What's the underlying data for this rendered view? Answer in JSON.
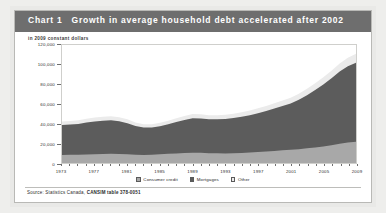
{
  "card": {
    "chart_label": "Chart 1",
    "title": "Growth in average household debt accelerated after 2002",
    "subtitle": "in 2009 constant dollars",
    "source_prefix": "Source: Statistics Canada, ",
    "source_table": "CANSIM table 378-0051",
    "colors": {
      "header_band": "#6e6e6e",
      "consumer_credit": "#a8a8a8",
      "mortgages": "#5c5c5c",
      "other": "#ebebeb",
      "card_background": "#ffffff",
      "page_background": "#e9e9e7",
      "axis": "#6f6f6f"
    }
  },
  "chart_data": {
    "type": "area",
    "stacked": true,
    "title": "Growth in average household debt accelerated after 2002",
    "subtitle": "in 2009 constant dollars",
    "xlabel": "",
    "ylabel": "",
    "ylim": [
      0,
      120000
    ],
    "yticks": [
      0,
      20000,
      40000,
      60000,
      80000,
      100000,
      120000
    ],
    "ytick_labels": [
      "0",
      "20,000",
      "40,000",
      "60,000",
      "80,000",
      "100,000",
      "120,000"
    ],
    "xlim": [
      1973,
      2009
    ],
    "xticks": [
      1973,
      1977,
      1981,
      1985,
      1989,
      1993,
      1997,
      2001,
      2005,
      2009
    ],
    "xtick_labels": [
      "1973",
      "1977",
      "1981",
      "1985",
      "1989",
      "1993",
      "1997",
      "2001",
      "2005",
      "2009"
    ],
    "grid": false,
    "legend_position": "bottom",
    "legend": [
      "Consumer credit",
      "Mortgages",
      "Other"
    ],
    "x": [
      1973,
      1974,
      1975,
      1976,
      1977,
      1978,
      1979,
      1980,
      1981,
      1982,
      1983,
      1984,
      1985,
      1986,
      1987,
      1988,
      1989,
      1990,
      1991,
      1992,
      1993,
      1994,
      1995,
      1996,
      1997,
      1998,
      1999,
      2000,
      2001,
      2002,
      2003,
      2004,
      2005,
      2006,
      2007,
      2008,
      2009
    ],
    "series": [
      {
        "name": "Consumer credit",
        "color": "#a8a8a8",
        "values": [
          8200,
          8300,
          8500,
          8700,
          8900,
          9100,
          9300,
          9200,
          8900,
          8400,
          8200,
          8400,
          8800,
          9300,
          9700,
          10100,
          10400,
          10300,
          10000,
          9800,
          9700,
          9900,
          10200,
          10600,
          11100,
          11700,
          12300,
          12900,
          13400,
          14100,
          14900,
          15800,
          16900,
          18100,
          19500,
          20800,
          21500
        ]
      },
      {
        "name": "Mortgages",
        "color": "#5c5c5c",
        "values": [
          30500,
          30900,
          31200,
          32400,
          33400,
          33900,
          34100,
          33200,
          31600,
          29300,
          27900,
          27700,
          28600,
          30000,
          31900,
          33700,
          35100,
          34900,
          34400,
          34600,
          35000,
          35900,
          36800,
          38000,
          39600,
          41200,
          43100,
          45000,
          47100,
          50200,
          54000,
          58400,
          63000,
          68000,
          73500,
          77500,
          80500
        ]
      },
      {
        "name": "Other",
        "color": "#ebebeb",
        "values": [
          3500,
          3600,
          3700,
          3900,
          4000,
          4100,
          4200,
          4100,
          3900,
          3600,
          3400,
          3400,
          3500,
          3700,
          3900,
          4100,
          4300,
          4300,
          4200,
          4200,
          4300,
          4400,
          4500,
          4700,
          4900,
          5100,
          5300,
          5600,
          5800,
          6100,
          6500,
          6900,
          7300,
          7800,
          8300,
          8700,
          9000
        ]
      }
    ],
    "totals": [
      42200,
      42800,
      43400,
      45000,
      46300,
      47100,
      47600,
      46500,
      44400,
      41300,
      39500,
      39500,
      40900,
      43000,
      45500,
      47900,
      49800,
      49500,
      48600,
      48600,
      49000,
      50200,
      51500,
      53300,
      55600,
      58000,
      60700,
      63500,
      66300,
      70400,
      75400,
      81100,
      87200,
      93900,
      101300,
      107000,
      111000
    ],
    "annotations": []
  }
}
